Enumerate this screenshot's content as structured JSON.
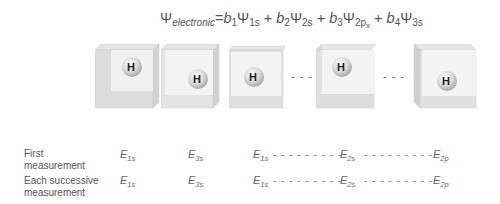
{
  "equation": {
    "lhs_symbol": "Ψ",
    "lhs_sub": "electronic",
    "equals": "=",
    "terms": [
      {
        "coef": "b",
        "coef_sub": "1",
        "psi": "Ψ",
        "psi_sub": "1s"
      },
      {
        "coef": "b",
        "coef_sub": "2",
        "psi": "Ψ",
        "psi_sub": "2s"
      },
      {
        "coef": "b",
        "coef_sub": "3",
        "psi": "Ψ",
        "psi_sub": "2p",
        "psi_sub2": "x"
      },
      {
        "coef": "b",
        "coef_sub": "4",
        "psi": "Ψ",
        "psi_sub": "3s"
      }
    ],
    "plus": "+"
  },
  "boxes": [
    {
      "atom": "H"
    },
    {
      "atom": "H"
    },
    {
      "atom": "H"
    },
    {
      "atom": "H"
    },
    {
      "atom": "H"
    }
  ],
  "ellipsis": "- - -",
  "rows": [
    {
      "label_line1": "First",
      "label_line2": "measurement",
      "values": [
        {
          "sym": "E",
          "sub": "1s"
        },
        {
          "sym": "E",
          "sub": "3s"
        },
        {
          "sym": "E",
          "sub": "1s"
        },
        {
          "sym": "E",
          "sub": "2s"
        },
        {
          "sym": "E",
          "sub": "2p"
        }
      ],
      "dash": "- - - - - - - - -"
    },
    {
      "label_line1": "Each successive",
      "label_line2": "measurement",
      "values": [
        {
          "sym": "E",
          "sub": "1s"
        },
        {
          "sym": "E",
          "sub": "3s"
        },
        {
          "sym": "E",
          "sub": "1s"
        },
        {
          "sym": "E",
          "sub": "2s"
        },
        {
          "sym": "E",
          "sub": "2p"
        }
      ],
      "dash": "- - - - - - - - -"
    }
  ]
}
